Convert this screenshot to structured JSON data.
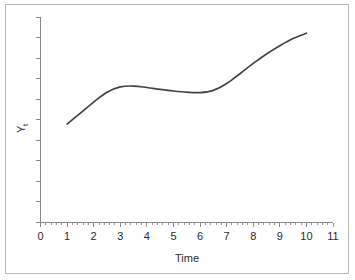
{
  "chart_data": {
    "type": "line",
    "title": "",
    "xlabel": "Time",
    "ylabel": "Y",
    "ylabel_subscript": "t",
    "xlim": [
      0,
      11
    ],
    "ylim": [
      0,
      1
    ],
    "grid": false,
    "legend": null,
    "x_ticks": [
      "0",
      "1",
      "2",
      "3",
      "4",
      "5",
      "6",
      "7",
      "8",
      "9",
      "10",
      "11"
    ],
    "x_tick_values": [
      0,
      1,
      2,
      3,
      4,
      5,
      6,
      7,
      8,
      9,
      10,
      11
    ],
    "x_minor_ticks_per_interval": 4,
    "y_ticks": [],
    "y_tick_count": 11,
    "y_axis_labeled": false,
    "line_color": "#434343",
    "axis_color": "#8a8a8a",
    "border_color": "#b9b9b9",
    "background_color": "#ffffff",
    "series": [
      {
        "name": "Yt",
        "x": [
          1.0,
          1.5,
          2.0,
          2.5,
          3.0,
          3.5,
          4.0,
          4.5,
          5.0,
          5.5,
          6.0,
          6.5,
          7.0,
          7.5,
          8.0,
          8.5,
          9.0,
          9.5,
          10.0
        ],
        "values": [
          0.479,
          0.532,
          0.586,
          0.634,
          0.66,
          0.664,
          0.657,
          0.648,
          0.64,
          0.634,
          0.632,
          0.643,
          0.676,
          0.724,
          0.774,
          0.82,
          0.86,
          0.895,
          0.921
        ]
      }
    ],
    "annotations": []
  }
}
